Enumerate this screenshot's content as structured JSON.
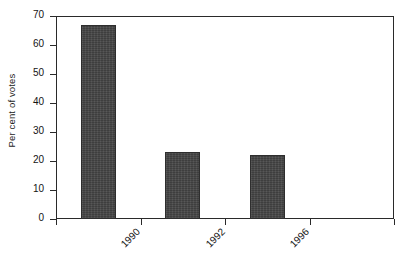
{
  "chart_data": {
    "type": "bar",
    "title": "",
    "subtitle": "",
    "xlabel": "",
    "ylabel": "Per cent of votes",
    "categories": [
      "1990",
      "1992",
      "1996",
      ""
    ],
    "values": [
      67,
      23,
      22,
      null
    ],
    "series": [
      {
        "name": "Per cent of votes",
        "values": [
          67,
          23,
          22,
          null
        ]
      }
    ],
    "ylim": [
      0,
      70
    ],
    "yticks": [
      0,
      10,
      20,
      30,
      40,
      50,
      60,
      70
    ],
    "ytick_labels": [
      "0",
      "10",
      "20",
      "30",
      "40",
      "50",
      "60",
      "70"
    ],
    "xtick_labels": [
      "1990",
      "1992",
      "1996"
    ],
    "xtick_rotation": -45,
    "grid": false,
    "legend": false,
    "legend_position": "none",
    "bar_color": "#444444",
    "bar_edge_color": "#2e2e2e",
    "axis_color": "#2a2a2a",
    "background_color": "#ffffff",
    "annotations": []
  }
}
